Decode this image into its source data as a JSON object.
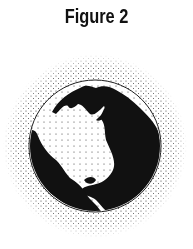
{
  "figure": {
    "title": "Figure 2",
    "colors": {
      "ink": "#111111",
      "background": "#ffffff"
    }
  }
}
